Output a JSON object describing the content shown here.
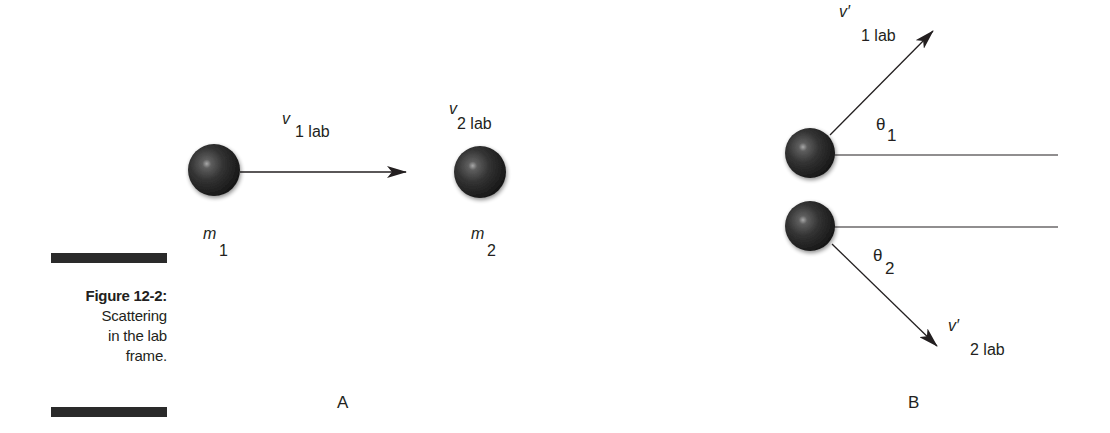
{
  "figure": {
    "number_label": "Figure 12-2:",
    "caption": "Scattering\nin the lab\nframe."
  },
  "panel_a": {
    "label": "A",
    "mass_1": {
      "symbol": "m",
      "subscript": "1"
    },
    "mass_2": {
      "symbol": "m",
      "subscript": "2"
    },
    "velocity_1": {
      "symbol": "v",
      "subscript": "1 lab"
    },
    "velocity_2": {
      "symbol": "v",
      "subscript": "2 lab"
    }
  },
  "panel_b": {
    "label": "B",
    "velocity_1_prime": {
      "symbol": "v′",
      "subscript": "1 lab"
    },
    "velocity_2_prime": {
      "symbol": "v′",
      "subscript": "2 lab"
    },
    "angle_1": {
      "symbol": "θ",
      "subscript": "1"
    },
    "angle_2": {
      "symbol": "θ",
      "subscript": "2"
    }
  },
  "colors": {
    "ink": "#231f20",
    "ball_dark": "#1a1a1a",
    "ball_highlight": "#9a9a9a",
    "bar": "#2a2a2a"
  }
}
